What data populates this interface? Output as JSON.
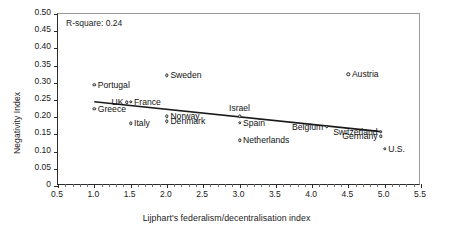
{
  "chart_data": {
    "type": "scatter",
    "title": "",
    "xlabel": "Lijphart's federalism/decentralisation index",
    "ylabel": "Negativity Index",
    "xlim": [
      0.5,
      5.5
    ],
    "ylim": [
      0.0,
      0.5
    ],
    "xticks": [
      "0.5",
      "1.0",
      "1.5",
      "2.0",
      "2.5",
      "3.0",
      "3.5",
      "4.0",
      "4.5",
      "5.0",
      "5.5"
    ],
    "yticks": [
      "0",
      "0.05",
      "0.10",
      "0.15",
      "0.20",
      "0.25",
      "0.30",
      "0.35",
      "0.40",
      "0.45",
      "0.50"
    ],
    "grid": false,
    "legend": null,
    "annotation": "R-square: 0.24",
    "points": [
      {
        "label": "Portugal",
        "x": 1.0,
        "y": 0.295,
        "pos": "r"
      },
      {
        "label": "Greece",
        "x": 1.0,
        "y": 0.225,
        "pos": "r"
      },
      {
        "label": "UK",
        "x": 1.45,
        "y": 0.243,
        "pos": "l"
      },
      {
        "label": "France",
        "x": 1.5,
        "y": 0.245,
        "pos": "r"
      },
      {
        "label": "Italy",
        "x": 1.5,
        "y": 0.182,
        "pos": "r"
      },
      {
        "label": "Sweden",
        "x": 2.0,
        "y": 0.322,
        "pos": "r"
      },
      {
        "label": "Norway",
        "x": 2.0,
        "y": 0.203,
        "pos": "r"
      },
      {
        "label": "Denmark",
        "x": 2.0,
        "y": 0.188,
        "pos": "r"
      },
      {
        "label": "Israel",
        "x": 3.0,
        "y": 0.203,
        "pos": "c"
      },
      {
        "label": "Spain",
        "x": 3.0,
        "y": 0.183,
        "pos": "r"
      },
      {
        "label": "Netherlands",
        "x": 3.0,
        "y": 0.133,
        "pos": "r"
      },
      {
        "label": "Belgium",
        "x": 4.2,
        "y": 0.172,
        "pos": "l"
      },
      {
        "label": "Switzerland",
        "x": 4.95,
        "y": 0.158,
        "pos": "l"
      },
      {
        "label": "Germany",
        "x": 4.95,
        "y": 0.145,
        "pos": "l"
      },
      {
        "label": "Austria",
        "x": 4.5,
        "y": 0.325,
        "pos": "r"
      },
      {
        "label": "U.S.",
        "x": 5.0,
        "y": 0.108,
        "pos": "r"
      }
    ],
    "trendline": {
      "x0": 1.0,
      "y0": 0.245,
      "x1": 4.95,
      "y1": 0.158
    }
  }
}
